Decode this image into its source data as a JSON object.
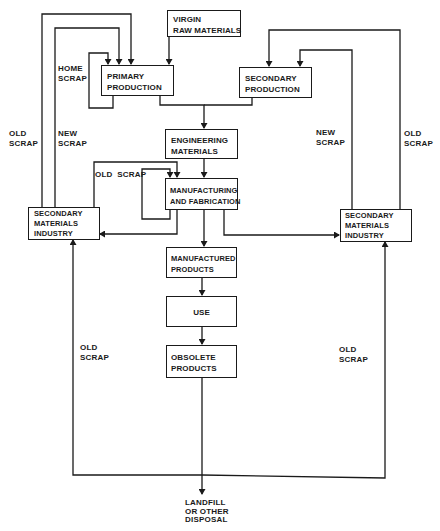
{
  "diagram": {
    "nodes": {
      "virgin": [
        "VIRGIN",
        "RAW MATERIALS"
      ],
      "primary": [
        "PRIMARY",
        "PRODUCTION"
      ],
      "secondary_prod": [
        "SECONDARY",
        "PRODUCTION"
      ],
      "engineering": [
        "ENGINEERING",
        "MATERIALS"
      ],
      "manufacturing": [
        "MANUFACTURING",
        "AND FABRICATION"
      ],
      "smi_left": [
        "SECONDARY",
        "MATERIALS",
        "INDUSTRY"
      ],
      "smi_right": [
        "SECONDARY",
        "MATERIALS",
        "INDUSTRY"
      ],
      "manufactured": [
        "MANUFACTURED",
        "PRODUCTS"
      ],
      "use": [
        "USE"
      ],
      "obsolete": [
        "OBSOLETE",
        "PRODUCTS"
      ],
      "landfill": [
        "LANDFILL",
        "OR OTHER",
        "DISPOSAL"
      ]
    },
    "labels": {
      "home_scrap": [
        "HOME",
        "SCRAP"
      ],
      "old_scrap_left_outer": [
        "OLD",
        "SCRAP"
      ],
      "new_scrap_left": [
        "NEW",
        "SCRAP"
      ],
      "old_scrap_mid": [
        "OLD  SCRAP"
      ],
      "new_scrap_right": [
        "NEW",
        "SCRAP"
      ],
      "old_scrap_right_outer": [
        "OLD",
        "SCRAP"
      ],
      "old_scrap_lower_left": [
        "OLD",
        "SCRAP"
      ],
      "old_scrap_lower_right": [
        "OLD",
        "SCRAP"
      ]
    },
    "edges": [
      {
        "from": "VIRGIN RAW MATERIALS",
        "to": "PRIMARY PRODUCTION"
      },
      {
        "from": "PRIMARY PRODUCTION",
        "to": "PRIMARY PRODUCTION",
        "label": "HOME SCRAP"
      },
      {
        "from": "SECONDARY MATERIALS INDUSTRY (left)",
        "to": "PRIMARY PRODUCTION",
        "label": "OLD SCRAP"
      },
      {
        "from": "SECONDARY MATERIALS INDUSTRY (left)",
        "to": "PRIMARY PRODUCTION",
        "label": "NEW SCRAP"
      },
      {
        "from": "PRIMARY PRODUCTION",
        "to": "ENGINEERING MATERIALS"
      },
      {
        "from": "SECONDARY PRODUCTION",
        "to": "ENGINEERING MATERIALS"
      },
      {
        "from": "SECONDARY MATERIALS INDUSTRY (right)",
        "to": "SECONDARY PRODUCTION",
        "label": "NEW SCRAP"
      },
      {
        "from": "SECONDARY MATERIALS INDUSTRY (right)",
        "to": "SECONDARY PRODUCTION",
        "label": "OLD SCRAP"
      },
      {
        "from": "ENGINEERING MATERIALS",
        "to": "MANUFACTURING AND FABRICATION"
      },
      {
        "from": "MANUFACTURING AND FABRICATION",
        "to": "MANUFACTURING AND FABRICATION"
      },
      {
        "from": "SECONDARY MATERIALS INDUSTRY (left)",
        "to": "MANUFACTURING AND FABRICATION",
        "label": "OLD SCRAP"
      },
      {
        "from": "MANUFACTURING AND FABRICATION",
        "to": "SECONDARY MATERIALS INDUSTRY (left)"
      },
      {
        "from": "MANUFACTURING AND FABRICATION",
        "to": "SECONDARY MATERIALS INDUSTRY (right)"
      },
      {
        "from": "MANUFACTURING AND FABRICATION",
        "to": "MANUFACTURED PRODUCTS"
      },
      {
        "from": "MANUFACTURED PRODUCTS",
        "to": "USE"
      },
      {
        "from": "USE",
        "to": "OBSOLETE PRODUCTS"
      },
      {
        "from": "OBSOLETE PRODUCTS",
        "to": "LANDFILL OR OTHER DISPOSAL"
      },
      {
        "from": "OBSOLETE PRODUCTS",
        "to": "SECONDARY MATERIALS INDUSTRY (left)",
        "label": "OLD SCRAP"
      },
      {
        "from": "OBSOLETE PRODUCTS",
        "to": "SECONDARY MATERIALS INDUSTRY (right)",
        "label": "OLD SCRAP"
      }
    ],
    "line_color": "#1a1a1a"
  }
}
